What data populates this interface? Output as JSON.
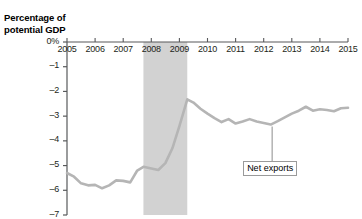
{
  "axis_title": {
    "line1": "Percentage of",
    "line2": "potential GDP"
  },
  "annotations": {
    "net_exports_label": "Net exports"
  },
  "colors": {
    "line": "#b5b5b5",
    "recession_band": "#d2d2d2",
    "axis": "#58595b",
    "text": "#231f20",
    "callout_border": "#9a9a9a",
    "background": "#ffffff"
  },
  "chart_data": {
    "type": "line",
    "title": "",
    "subtitle": "",
    "xlabel": "",
    "ylabel": "Percentage of potential GDP",
    "xlim": [
      2005,
      2015
    ],
    "ylim": [
      -7,
      0
    ],
    "grid": false,
    "legend": "none",
    "ytick_labels": [
      "0%",
      "–1",
      "–2",
      "–3",
      "–4",
      "–5",
      "–6",
      "–7"
    ],
    "ytick_values": [
      0,
      -1,
      -2,
      -3,
      -4,
      -5,
      -6,
      -7
    ],
    "xtick_labels": [
      "2005",
      "2006",
      "2007",
      "2008",
      "2009",
      "2010",
      "2011",
      "2012",
      "2013",
      "2014",
      "2015"
    ],
    "xtick_values": [
      2005,
      2006,
      2007,
      2008,
      2009,
      2010,
      2011,
      2012,
      2013,
      2014,
      2015
    ],
    "shaded_regions": [
      {
        "label": "recession",
        "x_start": 2007.72,
        "x_end": 2009.28
      }
    ],
    "series": [
      {
        "name": "Net exports",
        "x": [
          2005.0,
          2005.25,
          2005.5,
          2005.75,
          2006.0,
          2006.25,
          2006.5,
          2006.75,
          2007.0,
          2007.25,
          2007.5,
          2007.72,
          2008.0,
          2008.25,
          2008.5,
          2008.75,
          2009.0,
          2009.28,
          2009.5,
          2009.75,
          2010.0,
          2010.25,
          2010.5,
          2010.75,
          2011.0,
          2011.25,
          2011.5,
          2011.75,
          2012.0,
          2012.25,
          2012.5,
          2012.75,
          2013.0,
          2013.25,
          2013.5,
          2013.75,
          2014.0,
          2014.25,
          2014.5,
          2014.75,
          2015.0
        ],
        "y": [
          -5.3,
          -5.45,
          -5.72,
          -5.8,
          -5.78,
          -5.92,
          -5.8,
          -5.6,
          -5.62,
          -5.68,
          -5.2,
          -5.05,
          -5.12,
          -5.18,
          -4.9,
          -4.3,
          -3.4,
          -2.32,
          -2.45,
          -2.7,
          -2.9,
          -3.08,
          -3.24,
          -3.12,
          -3.3,
          -3.22,
          -3.12,
          -3.22,
          -3.28,
          -3.34,
          -3.2,
          -3.05,
          -2.9,
          -2.78,
          -2.62,
          -2.78,
          -2.72,
          -2.75,
          -2.8,
          -2.68,
          -2.66
        ]
      }
    ],
    "annotations": [
      {
        "text": "Net exports",
        "x": 2012.3,
        "y": -3.34,
        "callout": true
      }
    ]
  }
}
